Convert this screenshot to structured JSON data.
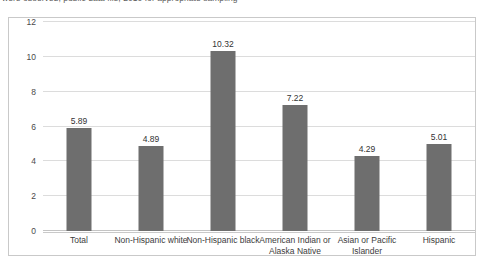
{
  "caption": {
    "text": "were observed; public data file; 2010 for appropriate sampling"
  },
  "chart_data": {
    "type": "bar",
    "title": "",
    "subtitle": "",
    "xlabel": "",
    "ylabel": "",
    "categories": [
      "Total",
      "Non-Hispanic white",
      "Non-Hispanic black",
      "American Indian or Alaska Native",
      "Asian or Pacific Islander",
      "Hispanic"
    ],
    "values": [
      5.89,
      4.89,
      10.32,
      7.22,
      4.29,
      5.01
    ],
    "value_labels": [
      "5.89",
      "4.89",
      "10.32",
      "7.22",
      "4.29",
      "5.01"
    ],
    "ylim": [
      0,
      12
    ],
    "yticks": [
      0,
      2,
      4,
      6,
      8,
      10,
      12
    ],
    "ytick_labels": [
      "0",
      "2",
      "4",
      "6",
      "8",
      "10",
      "12"
    ],
    "grid": true,
    "legend": "none",
    "bar_color": "#6e6e6e",
    "gridline_color": "#dcdcdc",
    "frame_color": "#c9c9c9"
  }
}
